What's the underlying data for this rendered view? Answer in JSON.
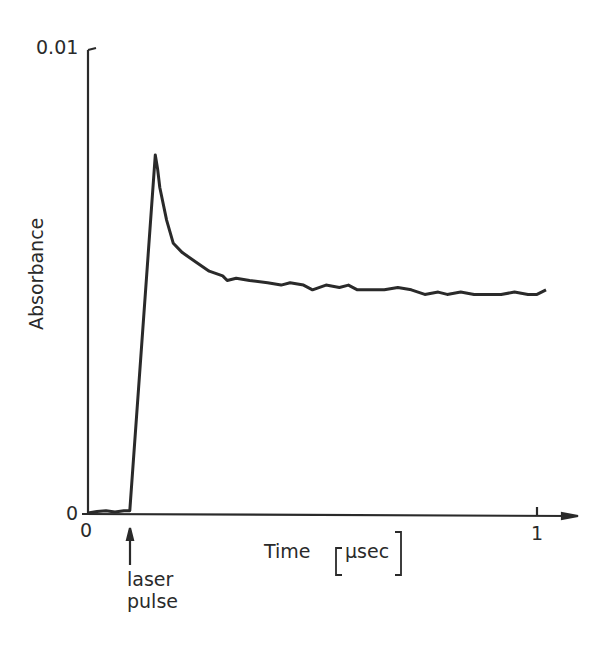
{
  "chart_data": {
    "type": "line",
    "title": "",
    "xlabel": "Time [µsec]",
    "ylabel": "Absorbance",
    "xlim": [
      0,
      1.05
    ],
    "ylim": [
      0,
      0.01
    ],
    "x_ticks": [
      {
        "value": 0,
        "label": "0"
      },
      {
        "value": 1,
        "label": "1"
      }
    ],
    "y_ticks": [
      {
        "value": 0,
        "label": "0"
      },
      {
        "value": 0.01,
        "label": "0.01"
      }
    ],
    "grid": false,
    "legend": null,
    "annotations": [
      {
        "text": "laser pulse",
        "x": 0.093,
        "arrow": "up"
      }
    ],
    "data_note": "Points are approximate, reconstructed from visual reading of the trace; fine-scale noise between zoomed regions is interpolated, not individually measured.",
    "series": [
      {
        "name": "Absorbance transient",
        "x": [
          0.0,
          0.02,
          0.04,
          0.06,
          0.08,
          0.093,
          0.15,
          0.155,
          0.16,
          0.175,
          0.19,
          0.21,
          0.24,
          0.27,
          0.3,
          0.31,
          0.33,
          0.36,
          0.4,
          0.43,
          0.45,
          0.48,
          0.5,
          0.53,
          0.56,
          0.58,
          0.6,
          0.63,
          0.66,
          0.69,
          0.72,
          0.75,
          0.78,
          0.8,
          0.83,
          0.86,
          0.89,
          0.92,
          0.95,
          0.98,
          1.0,
          1.02
        ],
        "y": [
          0.0,
          3e-05,
          5e-05,
          2e-05,
          5e-05,
          5e-05,
          0.0077,
          0.0074,
          0.007,
          0.0063,
          0.0058,
          0.0056,
          0.0054,
          0.0052,
          0.0051,
          0.005,
          0.00505,
          0.005,
          0.00495,
          0.0049,
          0.00495,
          0.0049,
          0.0048,
          0.0049,
          0.00485,
          0.0049,
          0.0048,
          0.0048,
          0.0048,
          0.00485,
          0.0048,
          0.0047,
          0.00475,
          0.0047,
          0.00475,
          0.0047,
          0.0047,
          0.0047,
          0.00475,
          0.0047,
          0.0047,
          0.0048
        ]
      }
    ]
  },
  "labels": {
    "y_top": "0.01",
    "y_zero": "0",
    "x_zero": "0",
    "x_one": "1",
    "x_axis_title": "Time",
    "x_axis_unit": "µsec",
    "y_axis_title": "Absorbance",
    "annotation_line1": "laser",
    "annotation_line2": "pulse"
  },
  "colors": {
    "ink": "#2a2a2a",
    "background": "#ffffff"
  }
}
